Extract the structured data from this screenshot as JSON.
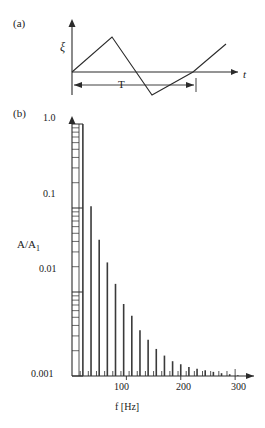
{
  "figure": {
    "panels": [
      {
        "id": "a",
        "label": "(a)",
        "type": "waveform",
        "y_axis_label": "ξ",
        "x_axis_label": "t",
        "period_label": "T",
        "description": "triangular wave"
      },
      {
        "id": "b",
        "label": "(b)",
        "type": "spectrum",
        "y_axis_label": "A/A",
        "y_axis_label_sub": "1",
        "x_axis_label": "f [Hz]"
      }
    ]
  },
  "chart_data": [
    {
      "type": "line",
      "title": "(a) Triangular wave",
      "xlabel": "t",
      "ylabel": "ξ",
      "annotations": [
        "T"
      ],
      "grid": false,
      "legend": "none",
      "x": [
        0,
        0.25,
        0.75,
        1.25,
        1.5
      ],
      "y": [
        0,
        1,
        -1,
        1,
        1.5
      ],
      "note": "periodic triangular waveform, period T marked by double arrow between t=0 and t=T"
    },
    {
      "type": "bar",
      "title": "(b) Harmonic amplitude spectrum of triangular wave",
      "xlabel": "f [Hz]",
      "ylabel": "A/A_1",
      "xlim": [
        0,
        320
      ],
      "ylim": [
        0.001,
        1.0
      ],
      "yscale": "log",
      "ytick_labels": [
        "1.0",
        "0.1",
        "0.01",
        "0.001"
      ],
      "ytick_values": [
        1.0,
        0.1,
        0.01,
        0.001
      ],
      "xtick_labels": [
        "100",
        "200",
        "300"
      ],
      "xtick_values": [
        100,
        200,
        300
      ],
      "grid": false,
      "legend": "none",
      "categories": [
        20,
        35,
        50,
        65,
        80,
        95,
        110,
        125,
        140,
        155,
        170,
        185,
        200,
        215,
        230,
        245,
        260,
        275,
        290,
        305
      ],
      "values": [
        1.0,
        0.105,
        0.042,
        0.0225,
        0.0125,
        0.0072,
        0.0052,
        0.0035,
        0.0027,
        0.0021,
        0.00175,
        0.0015,
        0.00138,
        0.00128,
        0.00122,
        0.00117,
        0.00112,
        0.00108,
        0.00105,
        0.00102
      ]
    }
  ],
  "colors": {
    "background": "#ffffff",
    "ink": "#2b2b2b",
    "text": "#1a1a1a"
  }
}
